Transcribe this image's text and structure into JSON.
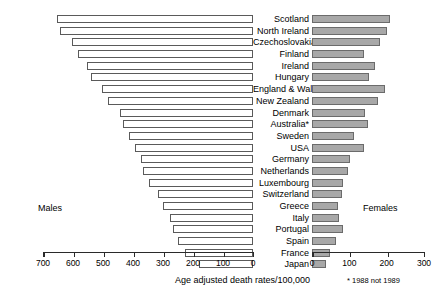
{
  "chart_data": {
    "type": "bar",
    "orientation": "horizontal",
    "style": "bilateral-pyramid",
    "title": "",
    "xlabel": "Age adjusted death rates/100,000",
    "ylabel": "",
    "footnote": "* 1988 not 1989",
    "left_panel_label": "Males",
    "right_panel_label": "Females",
    "left_axis": {
      "name": "Males",
      "ticks": [
        700,
        600,
        500,
        400,
        300,
        200,
        100,
        0
      ],
      "tick_labels": [
        "700",
        "600",
        "500",
        "400",
        "300",
        "200",
        "100",
        "0"
      ],
      "range": [
        700,
        0
      ],
      "direction": "right-to-left"
    },
    "right_axis": {
      "name": "Females",
      "ticks": [
        0,
        100,
        200,
        300
      ],
      "tick_labels": [
        "0",
        "100",
        "200",
        "300"
      ],
      "range": [
        0,
        300
      ],
      "direction": "left-to-right"
    },
    "grid": false,
    "legend": "none",
    "categories": [
      "Scotland",
      "North Ireland",
      "Czechoslovakia",
      "Finland",
      "Ireland",
      "Hungary",
      "England & Wales",
      "New Zealand",
      "Denmark",
      "Australia*",
      "Sweden",
      "USA",
      "Germany",
      "Netherlands",
      "Luxembourg",
      "Switzerland",
      "Greece",
      "Italy",
      "Portugal",
      "Spain",
      "France",
      "Japan"
    ],
    "series": [
      {
        "name": "Males",
        "side": "left",
        "color": "#ffffff",
        "values": [
          655,
          645,
          605,
          585,
          555,
          540,
          505,
          482,
          442,
          435,
          415,
          395,
          372,
          368,
          348,
          318,
          300,
          278,
          268,
          250,
          228,
          180
        ]
      },
      {
        "name": "Females",
        "side": "right",
        "color": "#a8a8a8",
        "values": [
          208,
          202,
          181,
          138,
          168,
          153,
          196,
          178,
          142,
          150,
          112,
          140,
          103,
          96,
          82,
          80,
          70,
          72,
          82,
          63,
          48,
          38
        ]
      }
    ]
  },
  "colors": {
    "male_bar_fill": "#ffffff",
    "male_bar_border": "#5a5a5a",
    "female_bar_fill": "#a8a8a8",
    "female_bar_border": "#6b6b6b",
    "axis": "#2a2a2a",
    "text": "#000000",
    "background": "#ffffff"
  }
}
